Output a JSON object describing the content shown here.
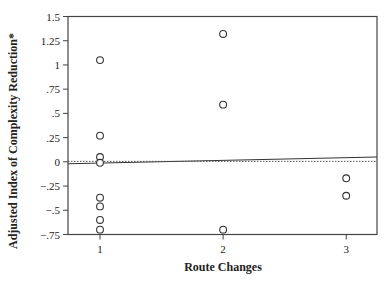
{
  "chart_data": {
    "type": "scatter",
    "title": "",
    "xlabel": "Route Changes",
    "ylabel": "Adjusted Index of Complexity Reduction*",
    "xlim": [
      0.74,
      3.25
    ],
    "ylim": [
      -0.75,
      1.5
    ],
    "xticks": [
      1,
      2,
      3
    ],
    "xtick_labels": [
      "1",
      "2",
      "3"
    ],
    "yticks": [
      1.5,
      1.25,
      1,
      0.75,
      0.5,
      0.25,
      0,
      -0.25,
      -0.5,
      -0.75
    ],
    "ytick_labels": [
      "1.5",
      "1.25",
      "1",
      ".75",
      ".5",
      ".25",
      "0",
      "−.25",
      "−.5",
      "−.75"
    ],
    "grid": false,
    "legend": null,
    "series": [
      {
        "name": "observations",
        "marker": "open-circle",
        "points": [
          {
            "x": 1,
            "y": 1.05
          },
          {
            "x": 1,
            "y": 0.27
          },
          {
            "x": 1,
            "y": 0.05
          },
          {
            "x": 1,
            "y": -0.01
          },
          {
            "x": 1,
            "y": -0.37
          },
          {
            "x": 1,
            "y": -0.46
          },
          {
            "x": 1,
            "y": -0.6
          },
          {
            "x": 1,
            "y": -0.7
          },
          {
            "x": 2,
            "y": 1.32
          },
          {
            "x": 2,
            "y": 0.59
          },
          {
            "x": 2,
            "y": -0.7
          },
          {
            "x": 3,
            "y": -0.17
          },
          {
            "x": 3,
            "y": -0.35
          }
        ]
      }
    ],
    "reference_lines": [
      {
        "name": "regression-line",
        "style": "solid",
        "x": [
          0.74,
          3.25
        ],
        "y": [
          -0.02,
          0.05
        ]
      },
      {
        "name": "zero-line",
        "style": "dotted",
        "y": 0
      }
    ]
  }
}
